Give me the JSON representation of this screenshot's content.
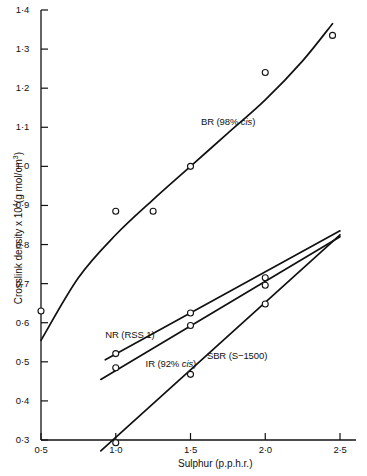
{
  "chart_data": {
    "type": "line",
    "title": "",
    "xlabel": "Sulphur (p.p.h.r.)",
    "ylabel": "Crosslink density x 10⁴ (g mol/cm³)",
    "xlim": [
      0.5,
      2.5
    ],
    "ylim": [
      0.3,
      1.4
    ],
    "xticks": [
      "0·5",
      "1·0",
      "1·5",
      "2·0",
      "2·5"
    ],
    "xtick_values": [
      0.5,
      1.0,
      1.5,
      2.0,
      2.5
    ],
    "yticks": [
      "0·3",
      "0·4",
      "0·5",
      "0·6",
      "0·7",
      "0·8",
      "0·9",
      "1·0",
      "1·1",
      "1·2",
      "1·3",
      "1·4"
    ],
    "ytick_values": [
      0.3,
      0.4,
      0.5,
      0.6,
      0.7,
      0.8,
      0.9,
      1.0,
      1.1,
      1.2,
      1.3,
      1.4
    ],
    "grid": false,
    "legend_position": "inline-annotations",
    "marker": "open-circle",
    "line_color": "#111111",
    "series": [
      {
        "name": "BR (98% cis)",
        "label_parts": {
          "prefix": "BR (98% ",
          "italic": "cis",
          "suffix": ")"
        },
        "label_x": 1.57,
        "label_y": 1.11,
        "fit_x": [
          0.5,
          0.75,
          1.0,
          1.25,
          1.5,
          1.75,
          2.0,
          2.25,
          2.45
        ],
        "fit_y": [
          0.555,
          0.715,
          0.825,
          0.915,
          1.0,
          1.085,
          1.17,
          1.27,
          1.365
        ],
        "points_x": [
          0.5,
          1.0,
          1.25,
          1.5,
          2.0,
          2.45
        ],
        "points_y": [
          0.63,
          0.885,
          0.885,
          1.0,
          1.24,
          1.335
        ]
      },
      {
        "name": "NR (RSS 1)",
        "label_parts": {
          "prefix": "NR (RSS 1)",
          "italic": "",
          "suffix": ""
        },
        "label_x": 0.93,
        "label_y": 0.566,
        "fit_x": [
          0.93,
          2.5
        ],
        "fit_y": [
          0.505,
          0.835
        ],
        "points_x": [
          1.0,
          1.5,
          2.0
        ],
        "points_y": [
          0.521,
          0.625,
          0.715
        ]
      },
      {
        "name": "IR (92% cis)",
        "label_parts": {
          "prefix": "IR (92% ",
          "italic": "cis",
          "suffix": ")"
        },
        "label_x": 1.2,
        "label_y": 0.492,
        "fit_x": [
          0.9,
          2.5
        ],
        "fit_y": [
          0.455,
          0.82
        ],
        "points_x": [
          1.0,
          1.5,
          2.0
        ],
        "points_y": [
          0.485,
          0.593,
          0.696
        ]
      },
      {
        "name": "SBR (S-1500)",
        "label_parts": {
          "prefix": "SBR (S−1500)",
          "italic": "",
          "suffix": ""
        },
        "label_x": 1.61,
        "label_y": 0.512,
        "fit_x": [
          0.9,
          2.5
        ],
        "fit_y": [
          0.272,
          0.825
        ],
        "points_x": [
          1.0,
          1.5,
          2.0
        ],
        "points_y": [
          0.293,
          0.468,
          0.648
        ]
      }
    ]
  }
}
